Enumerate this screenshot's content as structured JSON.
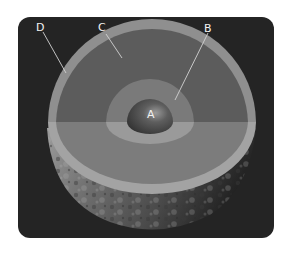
{
  "diagram": {
    "labels": {
      "a": "A",
      "b": "B",
      "c": "C",
      "d": "D"
    },
    "layers": [
      {
        "id": "A",
        "name": "inner-core",
        "color": "#5a5a5a"
      },
      {
        "id": "B",
        "name": "outer-core",
        "color": "#8a8a8a"
      },
      {
        "id": "C",
        "name": "mantle",
        "color": "#6a6a6a"
      },
      {
        "id": "D",
        "name": "crust",
        "color": "#9a9a9a"
      }
    ],
    "colors": {
      "background": "#242424",
      "page": "#ffffff",
      "leader_line": "#d0d0d0"
    }
  }
}
